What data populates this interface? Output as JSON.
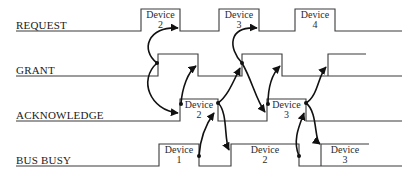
{
  "colors": {
    "line": "#3a3a3a",
    "arrow": "#111111",
    "text": "#1a1a1a",
    "background": "#ffffff"
  },
  "signals": [
    {
      "name": "REQUEST",
      "label_y": 26,
      "baseline_y": 31
    },
    {
      "name": "GRANT",
      "label_y": 71,
      "baseline_y": 76
    },
    {
      "name": "ACKNOWLEDGE",
      "label_y": 116,
      "baseline_y": 121
    },
    {
      "name": "BUS BUSY",
      "label_y": 161,
      "baseline_y": 166
    }
  ],
  "request": {
    "label": "REQUEST",
    "pulses": [
      {
        "device_word": "Device",
        "device_num": "2"
      },
      {
        "device_word": "Device",
        "device_num": "3"
      },
      {
        "device_word": "Device",
        "device_num": "4"
      }
    ]
  },
  "grant": {
    "label": "GRANT"
  },
  "acknowledge": {
    "label": "ACKNOWLEDGE",
    "pulses": [
      {
        "device_word": "Device",
        "device_num": "2"
      },
      {
        "device_word": "Device",
        "device_num": "3"
      }
    ]
  },
  "bus_busy": {
    "label": "BUS BUSY",
    "pulses": [
      {
        "device_word": "Device",
        "device_num": "1"
      },
      {
        "device_word": "Device",
        "device_num": "2"
      },
      {
        "device_word": "Device",
        "device_num": "3"
      }
    ]
  }
}
